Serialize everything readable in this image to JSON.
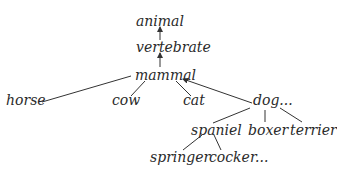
{
  "diagram": {
    "type": "taxonomy-tree",
    "nodes": {
      "animal": "animal",
      "vertebrate": "vertebrate",
      "mammal": "mammal",
      "horse": "horse",
      "cow": "cow",
      "cat": "cat",
      "dog": "dog...",
      "spaniel": "spaniel",
      "boxer": "boxer",
      "terrier": "terrier",
      "springer": "springer",
      "cocker": "cocker..."
    },
    "edges": [
      [
        "vertebrate",
        "animal"
      ],
      [
        "mammal",
        "vertebrate"
      ],
      [
        "horse",
        "mammal"
      ],
      [
        "cow",
        "mammal"
      ],
      [
        "cat",
        "mammal"
      ],
      [
        "dog",
        "mammal"
      ],
      [
        "spaniel",
        "dog"
      ],
      [
        "boxer",
        "dog"
      ],
      [
        "terrier",
        "dog"
      ],
      [
        "springer",
        "spaniel"
      ],
      [
        "cocker",
        "spaniel"
      ]
    ],
    "line_color": "#333333"
  }
}
